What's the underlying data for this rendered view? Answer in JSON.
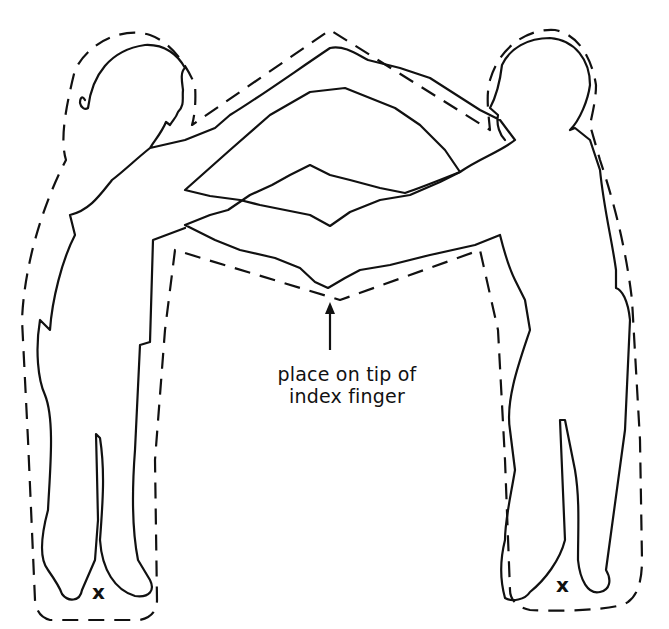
{
  "diagram": {
    "instruction": {
      "line1": "place on tip of",
      "line2": "index finger"
    },
    "markers": {
      "left_foot_mark": "x",
      "right_foot_mark": "x"
    },
    "elements": [
      "left-child-outline",
      "right-child-outline",
      "dashed-cut-line",
      "arrow",
      "instruction-label",
      "x-marks"
    ],
    "colors": {
      "line": "#111111",
      "background": "#ffffff"
    }
  }
}
